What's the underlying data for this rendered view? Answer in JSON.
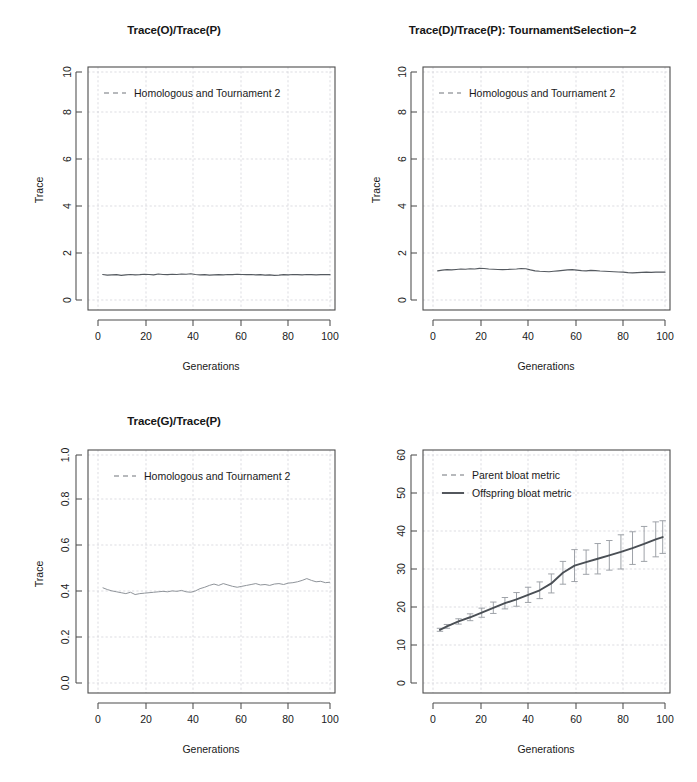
{
  "figure": {
    "background": "#ffffff",
    "line_color": "#555a60",
    "grid_color": "#cfcfd6",
    "panel_count": 4
  },
  "chart_data": [
    {
      "type": "line",
      "panel": "top-left",
      "title": "Trace(O)/Trace(P)",
      "xlabel": "Generations",
      "ylabel": "Trace",
      "xlim": [
        0,
        100
      ],
      "ylim": [
        0,
        10
      ],
      "xticks": [
        0,
        20,
        40,
        60,
        80,
        100
      ],
      "yticks": [
        0,
        2,
        4,
        6,
        8,
        10
      ],
      "grid": true,
      "legend": [
        "Homologous  and Tournament 2"
      ],
      "legend_position": "top-left-inside",
      "series": [
        {
          "name": "Homologous  and Tournament 2",
          "style": "solid",
          "x": [
            2,
            4,
            6,
            8,
            10,
            12,
            14,
            16,
            18,
            20,
            22,
            24,
            26,
            28,
            30,
            32,
            34,
            36,
            38,
            40,
            42,
            44,
            46,
            48,
            50,
            52,
            54,
            56,
            58,
            60,
            62,
            64,
            66,
            68,
            70,
            72,
            74,
            76,
            78,
            80,
            82,
            84,
            86,
            88,
            90,
            92,
            94,
            96,
            98,
            100
          ],
          "values": [
            1.12,
            1.09,
            1.1,
            1.11,
            1.08,
            1.1,
            1.12,
            1.1,
            1.11,
            1.13,
            1.12,
            1.1,
            1.14,
            1.12,
            1.11,
            1.13,
            1.12,
            1.14,
            1.13,
            1.15,
            1.12,
            1.1,
            1.11,
            1.09,
            1.1,
            1.11,
            1.1,
            1.12,
            1.11,
            1.13,
            1.12,
            1.11,
            1.12,
            1.1,
            1.11,
            1.09,
            1.1,
            1.08,
            1.09,
            1.11,
            1.1,
            1.12,
            1.11,
            1.1,
            1.12,
            1.11,
            1.1,
            1.11,
            1.12,
            1.11
          ]
        }
      ]
    },
    {
      "type": "line",
      "panel": "top-right",
      "title": "Trace(D)/Trace(P): TournamentSelection−2",
      "xlabel": "Generations",
      "ylabel": "Trace",
      "xlim": [
        0,
        100
      ],
      "ylim": [
        0,
        10
      ],
      "xticks": [
        0,
        20,
        40,
        60,
        80,
        100
      ],
      "yticks": [
        0,
        2,
        4,
        6,
        8,
        10
      ],
      "grid": true,
      "legend": [
        "Homologous  and Tournament 2"
      ],
      "legend_position": "top-left-inside",
      "series": [
        {
          "name": "Homologous  and Tournament 2",
          "style": "solid",
          "x": [
            2,
            4,
            6,
            8,
            10,
            12,
            14,
            16,
            18,
            20,
            22,
            24,
            26,
            28,
            30,
            32,
            34,
            36,
            38,
            40,
            42,
            44,
            46,
            48,
            50,
            52,
            54,
            56,
            58,
            60,
            62,
            64,
            66,
            68,
            70,
            72,
            74,
            76,
            78,
            80,
            82,
            84,
            86,
            88,
            90,
            92,
            94,
            96,
            98,
            100
          ],
          "values": [
            1.28,
            1.31,
            1.33,
            1.32,
            1.34,
            1.36,
            1.35,
            1.37,
            1.36,
            1.39,
            1.38,
            1.36,
            1.35,
            1.34,
            1.33,
            1.34,
            1.35,
            1.36,
            1.38,
            1.37,
            1.32,
            1.28,
            1.26,
            1.25,
            1.24,
            1.26,
            1.28,
            1.3,
            1.32,
            1.33,
            1.31,
            1.29,
            1.28,
            1.3,
            1.29,
            1.27,
            1.26,
            1.25,
            1.24,
            1.23,
            1.22,
            1.2,
            1.19,
            1.2,
            1.21,
            1.22,
            1.21,
            1.22,
            1.23,
            1.22
          ]
        }
      ]
    },
    {
      "type": "line",
      "panel": "bottom-left",
      "title": "Trace(G)/Trace(P)",
      "xlabel": "Generations",
      "ylabel": "Trace",
      "xlim": [
        0,
        100
      ],
      "ylim": [
        0.0,
        1.0
      ],
      "xticks": [
        0,
        20,
        40,
        60,
        80,
        100
      ],
      "yticks": [
        "0.0",
        "0.2",
        "0.4",
        "0.6",
        "0.8",
        "1.0"
      ],
      "grid": true,
      "legend": [
        "Homologous  and Tournament 2"
      ],
      "legend_position": "top-left-inside",
      "series": [
        {
          "name": "Homologous  and Tournament 2",
          "style": "solid",
          "x": [
            2,
            4,
            6,
            8,
            10,
            12,
            14,
            16,
            18,
            20,
            22,
            24,
            26,
            28,
            30,
            32,
            34,
            36,
            38,
            40,
            42,
            44,
            46,
            48,
            50,
            52,
            54,
            56,
            58,
            60,
            62,
            64,
            66,
            68,
            70,
            72,
            74,
            76,
            78,
            80,
            82,
            84,
            86,
            88,
            90,
            92,
            94,
            96,
            98,
            100
          ],
          "values": [
            0.418,
            0.41,
            0.404,
            0.4,
            0.396,
            0.392,
            0.398,
            0.388,
            0.392,
            0.394,
            0.396,
            0.398,
            0.4,
            0.402,
            0.4,
            0.404,
            0.402,
            0.406,
            0.4,
            0.398,
            0.404,
            0.414,
            0.42,
            0.428,
            0.434,
            0.428,
            0.436,
            0.43,
            0.424,
            0.42,
            0.424,
            0.428,
            0.432,
            0.436,
            0.43,
            0.432,
            0.428,
            0.434,
            0.436,
            0.432,
            0.438,
            0.44,
            0.444,
            0.45,
            0.458,
            0.45,
            0.444,
            0.446,
            0.44,
            0.442
          ]
        }
      ]
    },
    {
      "type": "line",
      "panel": "bottom-right",
      "title": "",
      "xlabel": "Generations",
      "ylabel": "",
      "xlim": [
        0,
        100
      ],
      "ylim": [
        0,
        60
      ],
      "xticks": [
        0,
        20,
        40,
        60,
        80,
        100
      ],
      "yticks": [
        0,
        10,
        20,
        30,
        40,
        50,
        60
      ],
      "grid": true,
      "legend": [
        "Parent bloat metric",
        "Offspring bloat metric"
      ],
      "legend_position": "top-left-inside",
      "series": [
        {
          "name": "Parent bloat metric",
          "style": "dashed",
          "x": [
            3,
            6,
            11,
            16,
            21,
            26,
            31,
            36,
            41,
            46,
            51,
            56,
            61,
            66,
            71,
            76,
            81,
            86,
            91,
            96,
            99
          ],
          "values": [
            14.0,
            14.9,
            16.2,
            17.3,
            18.5,
            19.8,
            21.0,
            22.0,
            23.2,
            24.4,
            26.2,
            29.0,
            30.9,
            31.8,
            32.7,
            33.6,
            34.5,
            35.5,
            36.6,
            37.8,
            38.4
          ],
          "errors": [
            0.4,
            0.5,
            0.7,
            0.9,
            1.2,
            1.5,
            1.5,
            1.8,
            2.0,
            2.2,
            2.5,
            3.0,
            4.2,
            3.2,
            4.0,
            3.9,
            4.5,
            4.3,
            4.6,
            4.6,
            4.3
          ]
        },
        {
          "name": "Offspring bloat metric",
          "style": "solid",
          "x": [
            3,
            6,
            11,
            16,
            21,
            26,
            31,
            36,
            41,
            46,
            51,
            56,
            61,
            66,
            71,
            76,
            81,
            86,
            91,
            96,
            99
          ],
          "values": [
            14.0,
            14.9,
            16.2,
            17.3,
            18.5,
            19.8,
            21.0,
            22.0,
            23.2,
            24.4,
            26.2,
            29.0,
            30.9,
            31.8,
            32.7,
            33.6,
            34.5,
            35.5,
            36.6,
            37.8,
            38.4
          ]
        }
      ]
    }
  ]
}
